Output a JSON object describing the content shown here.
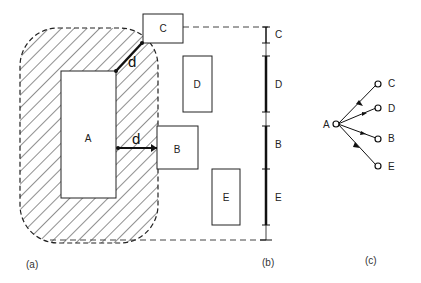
{
  "figure": {
    "panel_a": {
      "caption": "(a)",
      "boxes": [
        {
          "id": "A",
          "label": "A"
        },
        {
          "id": "B",
          "label": "B"
        },
        {
          "id": "C",
          "label": "C"
        },
        {
          "id": "D",
          "label": "D"
        },
        {
          "id": "E",
          "label": "E"
        }
      ],
      "distance_label_diagonal": "d",
      "distance_label_horizontal": "d"
    },
    "panel_b": {
      "caption": "(b)",
      "scale_segments": [
        {
          "label": "C"
        },
        {
          "label": "D"
        },
        {
          "label": "B"
        },
        {
          "label": "E"
        }
      ]
    },
    "panel_c": {
      "caption": "(c)",
      "source_node": "A",
      "target_nodes": [
        "C",
        "D",
        "B",
        "E"
      ]
    }
  }
}
